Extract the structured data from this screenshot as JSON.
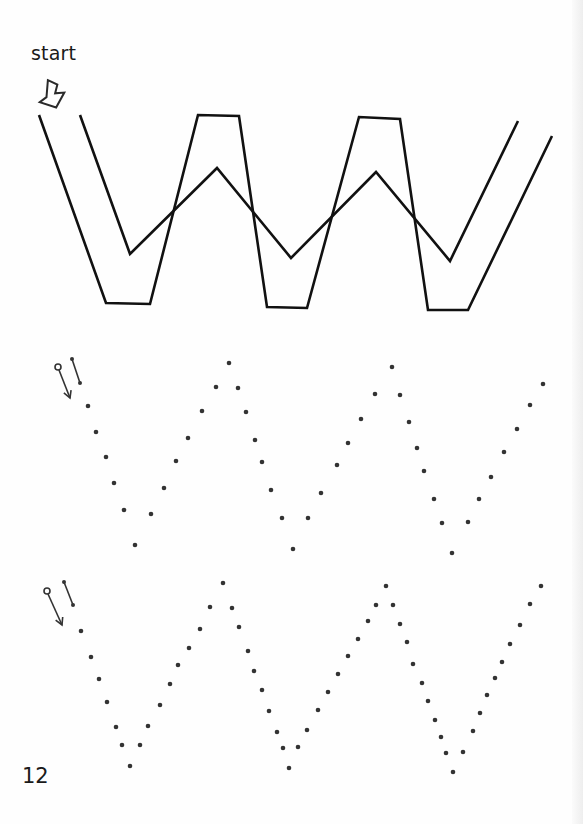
{
  "worksheet": {
    "start_label": "start",
    "page_number": "12",
    "letter": "W",
    "colors": {
      "ink": "#111111",
      "dot": "#333333",
      "arrow_outline": "#2a2a2a",
      "background": "#fefefe"
    },
    "outline_letter": {
      "outer_path": [
        [
          39,
          115
        ],
        [
          106,
          303
        ],
        [
          150,
          304
        ],
        [
          198,
          115
        ],
        [
          239,
          116
        ],
        [
          267,
          307
        ],
        [
          307,
          308
        ],
        [
          359,
          117
        ],
        [
          400,
          119
        ],
        [
          428,
          310
        ],
        [
          468,
          310
        ],
        [
          552,
          136
        ]
      ],
      "inner_path": [
        [
          80,
          115
        ],
        [
          130,
          254
        ],
        [
          217,
          168
        ],
        [
          291,
          258
        ],
        [
          376,
          172
        ],
        [
          450,
          261
        ],
        [
          518,
          121
        ]
      ]
    },
    "dotted_rows": [
      {
        "guide_arrow": {
          "circle": [
            58,
            367
          ],
          "line_to": [
            70,
            398
          ],
          "stroke_from": [
            72,
            359
          ],
          "stroke_to": [
            80,
            383
          ]
        },
        "dots": [
          [
            88,
            406
          ],
          [
            96,
            432
          ],
          [
            106,
            457
          ],
          [
            114,
            483
          ],
          [
            124,
            510
          ],
          [
            135,
            545
          ],
          [
            151,
            514
          ],
          [
            164,
            488
          ],
          [
            176,
            461
          ],
          [
            188,
            438
          ],
          [
            202,
            411
          ],
          [
            216,
            387
          ],
          [
            229,
            363
          ],
          [
            238,
            388
          ],
          [
            246,
            412
          ],
          [
            255,
            440
          ],
          [
            262,
            462
          ],
          [
            271,
            490
          ],
          [
            282,
            518
          ],
          [
            293,
            549
          ],
          [
            308,
            518
          ],
          [
            321,
            493
          ],
          [
            337,
            465
          ],
          [
            348,
            443
          ],
          [
            361,
            419
          ],
          [
            375,
            394
          ],
          [
            392,
            367
          ],
          [
            400,
            395
          ],
          [
            409,
            422
          ],
          [
            417,
            448
          ],
          [
            424,
            471
          ],
          [
            434,
            499
          ],
          [
            442,
            523
          ],
          [
            452,
            553
          ],
          [
            468,
            522
          ],
          [
            479,
            499
          ],
          [
            491,
            477
          ],
          [
            504,
            452
          ],
          [
            517,
            429
          ],
          [
            530,
            405
          ],
          [
            543,
            384
          ]
        ]
      },
      {
        "guide_arrow": {
          "circle": [
            47,
            591
          ],
          "line_to": [
            62,
            625
          ],
          "stroke_from": [
            64,
            582
          ],
          "stroke_to": [
            73,
            605
          ]
        },
        "dots": [
          [
            81,
            631
          ],
          [
            91,
            657
          ],
          [
            99,
            679
          ],
          [
            107,
            702
          ],
          [
            116,
            727
          ],
          [
            122,
            745
          ],
          [
            130,
            766
          ],
          [
            140,
            745
          ],
          [
            148,
            726
          ],
          [
            160,
            705
          ],
          [
            170,
            684
          ],
          [
            178,
            665
          ],
          [
            189,
            648
          ],
          [
            200,
            629
          ],
          [
            210,
            607
          ],
          [
            223,
            583
          ],
          [
            232,
            608
          ],
          [
            239,
            627
          ],
          [
            248,
            651
          ],
          [
            254,
            671
          ],
          [
            262,
            690
          ],
          [
            269,
            711
          ],
          [
            277,
            732
          ],
          [
            283,
            748
          ],
          [
            289,
            768
          ],
          [
            298,
            747
          ],
          [
            307,
            730
          ],
          [
            318,
            710
          ],
          [
            328,
            692
          ],
          [
            338,
            674
          ],
          [
            348,
            656
          ],
          [
            358,
            639
          ],
          [
            368,
            621
          ],
          [
            376,
            605
          ],
          [
            386,
            586
          ],
          [
            393,
            605
          ],
          [
            400,
            624
          ],
          [
            407,
            642
          ],
          [
            413,
            664
          ],
          [
            422,
            683
          ],
          [
            428,
            701
          ],
          [
            435,
            720
          ],
          [
            441,
            737
          ],
          [
            446,
            753
          ],
          [
            453,
            772
          ],
          [
            463,
            752
          ],
          [
            473,
            731
          ],
          [
            480,
            713
          ],
          [
            487,
            695
          ],
          [
            495,
            678
          ],
          [
            502,
            662
          ],
          [
            510,
            644
          ],
          [
            520,
            625
          ],
          [
            530,
            604
          ],
          [
            541,
            586
          ]
        ]
      }
    ]
  }
}
